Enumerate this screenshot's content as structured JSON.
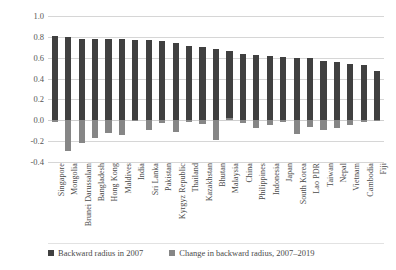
{
  "chart_data": {
    "type": "bar",
    "title": "",
    "subtitle": "",
    "xlabel": "",
    "ylabel": "Backward Radius",
    "ylim": [
      -0.4,
      1.0
    ],
    "yticks": [
      "1.0",
      "0.8",
      "0.6",
      "0.4",
      "0.2",
      "0.0",
      "-0.2",
      "-0.4"
    ],
    "ytick_values": [
      1.0,
      0.8,
      0.6,
      0.4,
      0.2,
      0.0,
      -0.2,
      -0.4
    ],
    "grid": true,
    "stacked": false,
    "legend_position": "bottom",
    "categories": [
      "Singapore",
      "Mongolia",
      "Brunei Darussalam",
      "Bangladesh",
      "Hong Kong",
      "Maldives",
      "India",
      "Sri Lanka",
      "Pakistan",
      "Kyrgyz Republic",
      "Thailand",
      "Kazakhstan",
      "Bhutan",
      "Malaysia",
      "China",
      "Philippines",
      "Indonesia",
      "Japan",
      "South Korea",
      "Lao PDR",
      "Taiwan",
      "Nepal",
      "Vietnam",
      "Cambodia",
      "Fiji"
    ],
    "series": [
      {
        "name": "Backward radius in 2007",
        "color": "#404040",
        "values": [
          0.81,
          0.8,
          0.78,
          0.78,
          0.78,
          0.78,
          0.77,
          0.77,
          0.76,
          0.74,
          0.71,
          0.7,
          0.68,
          0.66,
          0.64,
          0.63,
          0.62,
          0.61,
          0.6,
          0.6,
          0.57,
          0.56,
          0.54,
          0.53,
          0.47
        ]
      },
      {
        "name": "Change in backward radius, 2007-2019",
        "color": "#868686",
        "values": [
          -0.02,
          -0.29,
          -0.22,
          -0.17,
          -0.12,
          -0.14,
          -0.01,
          -0.09,
          -0.03,
          -0.11,
          -0.02,
          -0.04,
          -0.19,
          0.02,
          -0.03,
          -0.07,
          -0.05,
          -0.02,
          -0.13,
          -0.06,
          -0.09,
          -0.07,
          -0.05,
          -0.02,
          -0.01
        ]
      }
    ]
  },
  "legend": {
    "items": [
      {
        "label": "Backward radius in 2007",
        "color": "#404040"
      },
      {
        "label": "Change in backward radius, 2007–2019",
        "color": "#868686"
      }
    ]
  }
}
